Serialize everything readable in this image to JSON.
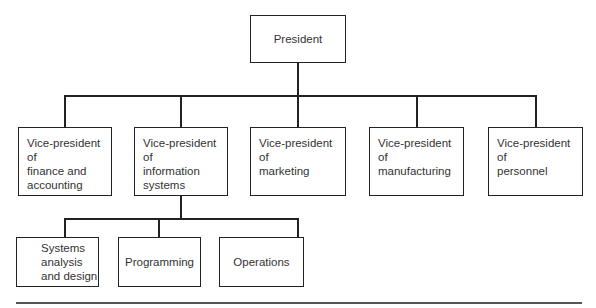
{
  "chart": {
    "root": {
      "label": "President"
    },
    "vice_presidents": [
      {
        "label": "Vice-president of finance and accounting",
        "lines": [
          "Vice-president of",
          "finance and",
          "accounting"
        ]
      },
      {
        "label": "Vice-president of information systems",
        "lines": [
          "Vice-president of",
          "information",
          "systems"
        ]
      },
      {
        "label": "Vice-president of marketing",
        "lines": [
          "Vice-president of",
          "marketing"
        ]
      },
      {
        "label": "Vice-president of manufacturing",
        "lines": [
          "Vice-president of",
          "manufacturing"
        ]
      },
      {
        "label": "Vice-president of personnel",
        "lines": [
          "Vice-president of",
          "personnel"
        ]
      }
    ],
    "information_systems_units": [
      {
        "label": "Systems analysis and design",
        "lines": [
          "Systems",
          "analysis",
          "and design"
        ]
      },
      {
        "label": "Programming",
        "lines": [
          "Programming"
        ]
      },
      {
        "label": "Operations",
        "lines": [
          "Operations"
        ]
      }
    ]
  }
}
